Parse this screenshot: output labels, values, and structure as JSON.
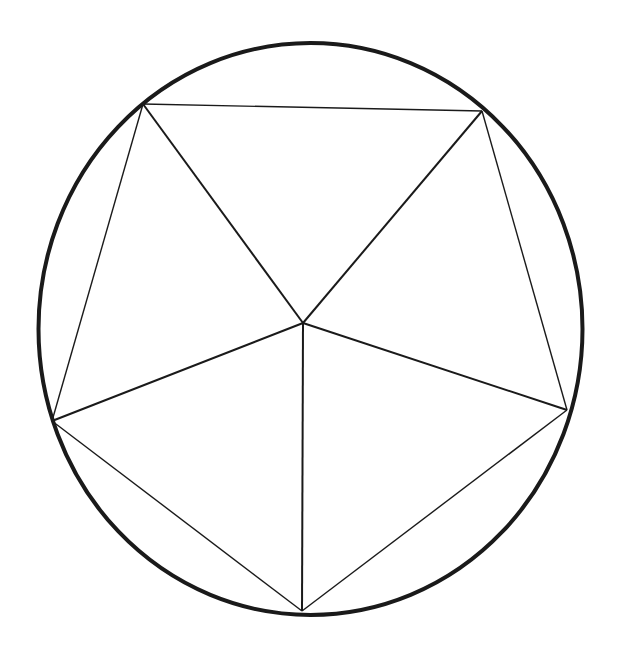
{
  "diagram": {
    "type": "geometric",
    "colors": {
      "stroke": "#1a1a1a",
      "background": "#ffffff"
    },
    "circle": {
      "cx": 310.5,
      "cy": 329,
      "rx": 272,
      "ry": 286,
      "stroke_width": 4
    },
    "center": {
      "x": 303,
      "y": 323
    },
    "vertices": [
      {
        "id": "top-left",
        "x": 143,
        "y": 104
      },
      {
        "id": "top-right",
        "x": 482,
        "y": 111
      },
      {
        "id": "right",
        "x": 567,
        "y": 410
      },
      {
        "id": "bottom",
        "x": 302,
        "y": 611
      },
      {
        "id": "left",
        "x": 52,
        "y": 421
      }
    ],
    "edge_stroke_width": 1.4,
    "spoke_stroke_width": 2
  }
}
